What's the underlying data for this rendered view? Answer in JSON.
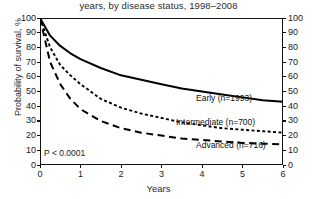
{
  "chart_data": {
    "type": "line",
    "title": "years, by disease status, 1998–2008",
    "xlabel": "Years",
    "ylabel": "Probability of survival, %",
    "xlim": [
      0,
      6
    ],
    "ylim": [
      0,
      100
    ],
    "xticks": [
      "0",
      "1",
      "2",
      "3",
      "4",
      "5",
      "6"
    ],
    "yticks": [
      "0",
      "10",
      "20",
      "30",
      "40",
      "50",
      "60",
      "70",
      "80",
      "90",
      "100"
    ],
    "yticks_right": [
      "0",
      "10",
      "20",
      "30",
      "40",
      "50",
      "60",
      "70",
      "80",
      "90",
      "100"
    ],
    "grid": false,
    "legend_position": "inline-right",
    "annotation": "P < 0.0001",
    "x": [
      0,
      0.25,
      0.5,
      0.75,
      1,
      1.5,
      2,
      2.5,
      3,
      3.5,
      4,
      4.5,
      5,
      5.5,
      6
    ],
    "series": [
      {
        "name": "Early",
        "label": "Early (n=1993)",
        "n": 1993,
        "linestyle": "solid",
        "color": "#000000",
        "values": [
          100,
          88,
          81,
          76,
          72,
          66,
          61,
          58,
          55,
          52,
          50,
          48,
          46,
          44,
          43
        ]
      },
      {
        "name": "Intermediate",
        "label": "Intermediate (n=700)",
        "n": 700,
        "linestyle": "dotted",
        "color": "#000000",
        "values": [
          100,
          80,
          68,
          61,
          55,
          45,
          39,
          35,
          32,
          29,
          27,
          25,
          24,
          23,
          22
        ]
      },
      {
        "name": "Advanced",
        "label": "Advanced (n=716)",
        "n": 716,
        "linestyle": "dashed",
        "color": "#000000",
        "values": [
          100,
          70,
          55,
          45,
          38,
          30,
          25,
          22,
          20,
          18,
          17,
          16,
          15,
          14.5,
          14
        ]
      }
    ]
  }
}
